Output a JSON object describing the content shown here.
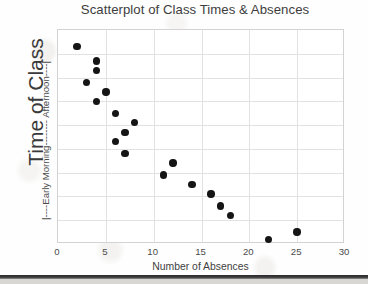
{
  "title": "Scatterplot of Class Times & Absences",
  "axes": {
    "y_title": "Time of Class",
    "y_range_label": "|----Early Morning-------- Afternoon----|",
    "x_title": "Number of Absences"
  },
  "colors": {
    "dot": "#151515",
    "grid": "#e2e2e2",
    "frame": "#d3d3d3",
    "text": "#3b3b3b",
    "background": "#fefefe"
  },
  "chart_data": {
    "type": "scatter",
    "title": "Scatterplot of Class Times & Absences",
    "xlabel": "Number of Absences",
    "ylabel": "Time of Class",
    "ylabel_annotation": "|----Early Morning-------- Afternoon----|",
    "xlim": [
      0,
      30
    ],
    "ylim": [
      0,
      9
    ],
    "xticks": [
      0,
      5,
      10,
      15,
      20,
      25,
      30
    ],
    "xticklabels": [
      "0",
      "5",
      "10",
      "15",
      "20",
      "25",
      "30"
    ],
    "yticks": [],
    "yticklabels": [],
    "grid": true,
    "legend": null,
    "y_axis_description": "Unlabeled ordinal scale; top of axis = Afternoon, bottom of axis = Early Morning",
    "point_count": 19,
    "points": [
      {
        "x": 2,
        "y": 8.3
      },
      {
        "x": 4,
        "y": 7.7
      },
      {
        "x": 4,
        "y": 7.3
      },
      {
        "x": 3,
        "y": 6.8
      },
      {
        "x": 5,
        "y": 6.4
      },
      {
        "x": 4,
        "y": 6.0
      },
      {
        "x": 6,
        "y": 5.5
      },
      {
        "x": 8,
        "y": 5.1
      },
      {
        "x": 7,
        "y": 4.7
      },
      {
        "x": 6,
        "y": 4.3
      },
      {
        "x": 7,
        "y": 3.8
      },
      {
        "x": 12,
        "y": 3.4
      },
      {
        "x": 11,
        "y": 2.9
      },
      {
        "x": 14,
        "y": 2.5
      },
      {
        "x": 16,
        "y": 2.1
      },
      {
        "x": 17,
        "y": 1.6
      },
      {
        "x": 18,
        "y": 1.2
      },
      {
        "x": 25,
        "y": 0.5
      },
      {
        "x": 22,
        "y": 0.2
      }
    ],
    "x_values": [
      2,
      4,
      4,
      3,
      5,
      4,
      6,
      8,
      7,
      6,
      7,
      12,
      11,
      14,
      16,
      17,
      18,
      25,
      22
    ],
    "y_values": [
      8.3,
      7.7,
      7.3,
      6.8,
      6.4,
      6.0,
      5.5,
      5.1,
      4.7,
      4.3,
      3.8,
      3.4,
      2.9,
      2.5,
      2.1,
      1.6,
      1.2,
      0.5,
      0.2
    ],
    "trend": "negative",
    "annotations": []
  }
}
